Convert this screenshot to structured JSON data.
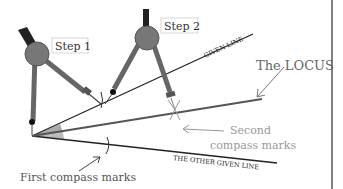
{
  "diagram": {
    "labels": {
      "step1": "Step 1",
      "step2": "Step 2",
      "given_line": "GIVEN LINE",
      "other_given_line": "THE OTHER GIVEN LINE",
      "locus": "The LOCUS",
      "second_marks_line1": "Second",
      "second_marks_line2": "compass marks",
      "first_marks": "First compass marks"
    },
    "colors": {
      "line": "#222222",
      "locus": "#555555",
      "annotation": "#999999",
      "compass_body": "#7a7a7a",
      "compass_head": "#6f6f6f",
      "angle_fill": "#aaaaaa",
      "label_text": "#333333",
      "border": "#555555"
    }
  }
}
